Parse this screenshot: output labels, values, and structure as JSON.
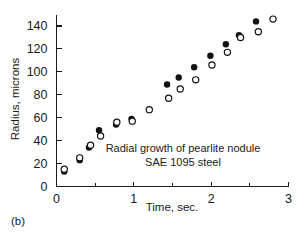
{
  "figure": {
    "panel_label": "(b)",
    "background_color": "#ffffff",
    "ink_color": "#1a1a1a"
  },
  "chart_data": {
    "type": "scatter",
    "title": "",
    "annotation_lines": [
      "Radial growth of pearlite nodule",
      "SAE 1095 steel"
    ],
    "xlabel": "Time, sec.",
    "ylabel": "Radius, microns",
    "xlim": [
      0,
      3
    ],
    "ylim": [
      0,
      150
    ],
    "xticks": [
      0,
      1,
      2,
      3
    ],
    "xtick_labels": [
      "0",
      "1",
      "2",
      "3"
    ],
    "x_minor_ticks": [
      0.5,
      1.5,
      2.5
    ],
    "yticks": [
      0,
      20,
      40,
      60,
      80,
      100,
      120,
      140
    ],
    "ytick_labels": [
      "0",
      "20",
      "40",
      "60",
      "80",
      "100",
      "120",
      "140"
    ],
    "grid": false,
    "legend": "none",
    "marker_colors": {
      "filled": "#121212",
      "open_stroke": "#121212",
      "open_fill": "#ffffff"
    },
    "series": [
      {
        "name": "filled-circles",
        "marker": "filled-circle",
        "points": [
          {
            "x": 0.1,
            "y": 13
          },
          {
            "x": 0.3,
            "y": 23
          },
          {
            "x": 0.42,
            "y": 34
          },
          {
            "x": 0.55,
            "y": 49
          },
          {
            "x": 0.77,
            "y": 54
          },
          {
            "x": 0.97,
            "y": 59
          },
          {
            "x": 1.43,
            "y": 89
          },
          {
            "x": 1.58,
            "y": 95
          },
          {
            "x": 1.78,
            "y": 104
          },
          {
            "x": 1.99,
            "y": 114
          },
          {
            "x": 2.19,
            "y": 124
          },
          {
            "x": 2.36,
            "y": 132
          },
          {
            "x": 2.58,
            "y": 144
          }
        ]
      },
      {
        "name": "open-circles",
        "marker": "open-circle",
        "points": [
          {
            "x": 0.1,
            "y": 15
          },
          {
            "x": 0.3,
            "y": 25
          },
          {
            "x": 0.44,
            "y": 36
          },
          {
            "x": 0.57,
            "y": 44
          },
          {
            "x": 0.78,
            "y": 56
          },
          {
            "x": 0.98,
            "y": 57
          },
          {
            "x": 1.2,
            "y": 67
          },
          {
            "x": 1.45,
            "y": 77
          },
          {
            "x": 1.6,
            "y": 85
          },
          {
            "x": 1.8,
            "y": 93
          },
          {
            "x": 2.01,
            "y": 106
          },
          {
            "x": 2.21,
            "y": 117
          },
          {
            "x": 2.38,
            "y": 130
          },
          {
            "x": 2.61,
            "y": 135
          },
          {
            "x": 2.8,
            "y": 146
          }
        ]
      }
    ]
  }
}
